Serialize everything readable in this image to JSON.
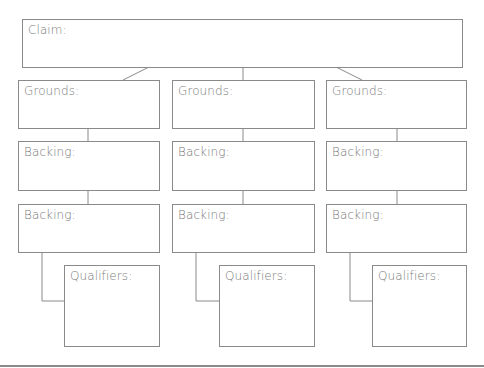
{
  "diagram": {
    "type": "toulmin-argument-organizer",
    "claim": {
      "label": "Claim:"
    },
    "columns": [
      {
        "grounds": "Grounds:",
        "backing1": "Backing:",
        "backing2": "Backing:",
        "qualifiers": "Qualifiers:"
      },
      {
        "grounds": "Grounds:",
        "backing1": "Backing:",
        "backing2": "Backing:",
        "qualifiers": "Qualifiers:"
      },
      {
        "grounds": "Grounds:",
        "backing1": "Backing:",
        "backing2": "Backing:",
        "qualifiers": "Qualifiers:"
      }
    ]
  },
  "colors": {
    "border": "#8a8a8a",
    "text": "#7a7a7a",
    "background": "#ffffff"
  }
}
